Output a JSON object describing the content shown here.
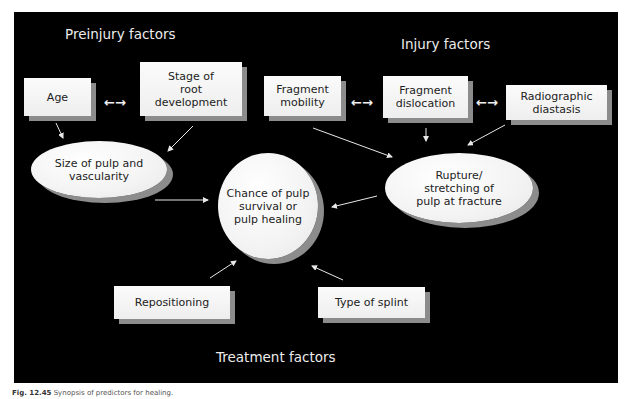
{
  "diagram": {
    "groups": {
      "preinjury": "Preinjury factors",
      "injury": "Injury factors",
      "treatment": "Treatment factors"
    },
    "nodes": {
      "age": "Age",
      "stage": [
        "Stage of",
        "root",
        "development"
      ],
      "size_pulp": [
        "Size of pulp and",
        "vascularity"
      ],
      "frag_mobility": [
        "Fragment",
        "mobility"
      ],
      "frag_dislocation": [
        "Fragment",
        "dislocation"
      ],
      "radiographic": [
        "Radiographic",
        "diastasis"
      ],
      "rupture": [
        "Rupture/",
        "stretching of",
        "pulp at fracture"
      ],
      "chance": [
        "Chance of pulp",
        "survival or",
        "pulp healing"
      ],
      "repositioning": "Repositioning",
      "splint": "Type of splint"
    },
    "double_arrow_glyph": "←→",
    "edges": [
      {
        "from": "Age",
        "to": "Size of pulp and vascularity"
      },
      {
        "from": "Stage of root development",
        "to": "Size of pulp and vascularity"
      },
      {
        "from": "Age",
        "to": "Stage of root development",
        "type": "bidirectional"
      },
      {
        "from": "Fragment mobility",
        "to": "Fragment dislocation",
        "type": "bidirectional"
      },
      {
        "from": "Fragment dislocation",
        "to": "Radiographic diastasis",
        "type": "bidirectional"
      },
      {
        "from": "Fragment mobility",
        "to": "Rupture/stretching of pulp at fracture"
      },
      {
        "from": "Fragment dislocation",
        "to": "Rupture/stretching of pulp at fracture"
      },
      {
        "from": "Radiographic diastasis",
        "to": "Rupture/stretching of pulp at fracture"
      },
      {
        "from": "Size of pulp and vascularity",
        "to": "Chance of pulp survival or pulp healing"
      },
      {
        "from": "Rupture/stretching of pulp at fracture",
        "to": "Chance of pulp survival or pulp healing"
      },
      {
        "from": "Repositioning",
        "to": "Chance of pulp survival or pulp healing"
      },
      {
        "from": "Type of splint",
        "to": "Chance of pulp survival or pulp healing"
      }
    ],
    "colors": {
      "background": "#000000",
      "box_fill": "#f5f5f5",
      "shadow": "#8c8c8c",
      "text_dark": "#222222",
      "text_light": "#ececec",
      "arrow": "#e8e8e8"
    }
  },
  "caption": {
    "label": "Fig. 12.45",
    "text": "Synopsis of predictors for healing."
  }
}
